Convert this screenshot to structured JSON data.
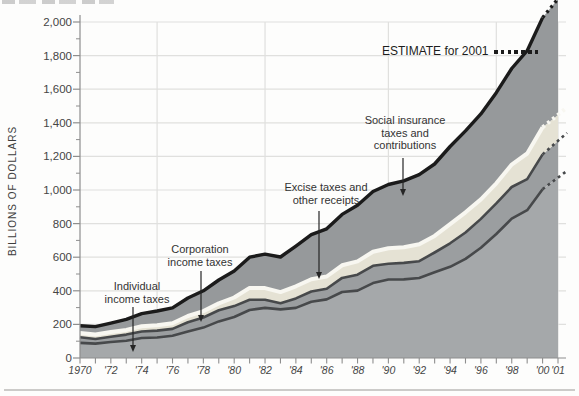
{
  "page": {
    "background": "#fdfdfc"
  },
  "chart_data": {
    "type": "area",
    "stacked": true,
    "title": "",
    "xlabel": "",
    "ylabel": "BILLIONS OF DOLLARS",
    "xlim": [
      1970,
      2001
    ],
    "ylim": [
      0,
      2000
    ],
    "grid": true,
    "legend_position": "none",
    "vertical_gridline_years": [
      1975,
      1982,
      1990,
      1997,
      2001
    ],
    "x": [
      1970,
      1971,
      1972,
      1973,
      1974,
      1975,
      1976,
      1977,
      1978,
      1979,
      1980,
      1981,
      1982,
      1983,
      1984,
      1985,
      1986,
      1987,
      1988,
      1989,
      1990,
      1991,
      1992,
      1993,
      1994,
      1995,
      1996,
      1997,
      1998,
      1999,
      2000,
      2001
    ],
    "x_tick_years": [
      1970,
      1972,
      1974,
      1976,
      1978,
      1980,
      1982,
      1984,
      1986,
      1988,
      1990,
      1992,
      1994,
      1996,
      1998,
      2000,
      2001
    ],
    "x_tick_labels": [
      "1970",
      "'72",
      "'74",
      "'76",
      "'78",
      "'80",
      "'82",
      "'84",
      "'86",
      "'88",
      "'90",
      "'92",
      "'94",
      "'96",
      "'98",
      "'00",
      "'01"
    ],
    "y_ticks": [
      0,
      200,
      400,
      600,
      800,
      1000,
      1200,
      1400,
      1600,
      1800,
      2000
    ],
    "y_tick_labels": [
      "0",
      "200",
      "400",
      "600",
      "800",
      "1,000",
      "1,200",
      "1,400",
      "1,600",
      "1,800",
      "2,000"
    ],
    "estimate": {
      "label": "ESTIMATE for 2001",
      "year": 2001,
      "style": "dotted"
    },
    "series": [
      {
        "name": "Individual income taxes",
        "values": [
          90,
          86,
          95,
          103,
          119,
          122,
          132,
          158,
          181,
          218,
          244,
          286,
          298,
          289,
          298,
          335,
          349,
          393,
          401,
          446,
          467,
          468,
          476,
          510,
          543,
          590,
          656,
          738,
          829,
          880,
          1005,
          1073
        ]
      },
      {
        "name": "Corporation income taxes",
        "values": [
          33,
          27,
          32,
          36,
          39,
          41,
          41,
          55,
          60,
          66,
          65,
          61,
          49,
          37,
          57,
          61,
          63,
          84,
          95,
          103,
          94,
          98,
          100,
          118,
          140,
          157,
          172,
          182,
          189,
          185,
          207,
          219
        ]
      },
      {
        "name": "Excise taxes and other receipts",
        "values": [
          25,
          27,
          28,
          28,
          31,
          32,
          34,
          37,
          38,
          41,
          51,
          70,
          69,
          66,
          72,
          73,
          73,
          75,
          79,
          83,
          92,
          93,
          101,
          99,
          114,
          120,
          116,
          120,
          133,
          152,
          161,
          155
        ]
      },
      {
        "name": "Social insurance taxes and contributions",
        "values": [
          44,
          47,
          53,
          63,
          75,
          85,
          91,
          107,
          121,
          139,
          158,
          183,
          202,
          209,
          239,
          265,
          284,
          303,
          334,
          359,
          380,
          396,
          414,
          428,
          462,
          485,
          509,
          539,
          572,
          612,
          653,
          690
        ]
      }
    ]
  },
  "annotations": {
    "individual": "Individual\nincome taxes",
    "corporation": "Corporation\nincome taxes",
    "excise": "Excise taxes and\nother receipts",
    "social": "Social insurance\ntaxes and\ncontributions",
    "estimate": "ESTIMATE for 2001"
  },
  "colors": {
    "individual_fill": "#a5a8aa",
    "corporation_fill": "#9b9ea0",
    "excise_fill": "#e5e2d4",
    "excise_top_line": "#f8f7f1",
    "social_fill": "#96999b",
    "layer_line": "#47494b",
    "total_line": "#1b1b1b",
    "grid": "#e0e0de",
    "axis": "#8e8e8e",
    "arrow": "#262626",
    "text": "#3d3d3d"
  }
}
